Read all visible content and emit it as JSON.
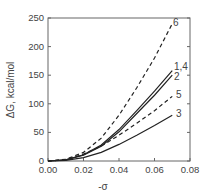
{
  "chart_data": {
    "type": "line",
    "title": "",
    "xlabel": "-σ",
    "ylabel": "ΔG, kcal/mol",
    "xlim": [
      0,
      0.08
    ],
    "ylim": [
      0,
      250
    ],
    "xticks": [
      "0.00",
      "0.02",
      "0.04",
      "0.06",
      "0.08"
    ],
    "yticks": [
      "0",
      "50",
      "100",
      "150",
      "200",
      "250"
    ],
    "grid": false,
    "legend": "inline labels at line ends",
    "x": [
      0.0,
      0.01,
      0.02,
      0.03,
      0.04,
      0.05,
      0.06,
      0.07
    ],
    "series": [
      {
        "name": "6",
        "style": "dashed",
        "values": [
          0,
          3,
          15,
          40,
          80,
          128,
          180,
          240
        ]
      },
      {
        "name": "1,4",
        "style": "solid",
        "values": [
          0,
          2,
          11,
          28,
          55,
          88,
          122,
          158
        ]
      },
      {
        "name": "2",
        "style": "solid",
        "values": [
          0,
          2,
          10,
          26,
          51,
          83,
          115,
          150
        ]
      },
      {
        "name": "5",
        "style": "dashed",
        "values": [
          0,
          2,
          12,
          26,
          45,
          66,
          88,
          113
        ]
      },
      {
        "name": "3",
        "style": "solid",
        "values": [
          0,
          1,
          6,
          15,
          29,
          45,
          62,
          80
        ]
      }
    ]
  },
  "labels": {
    "s6": "6",
    "s14": "1,4",
    "s2": "2",
    "s5": "5",
    "s3": "3"
  }
}
